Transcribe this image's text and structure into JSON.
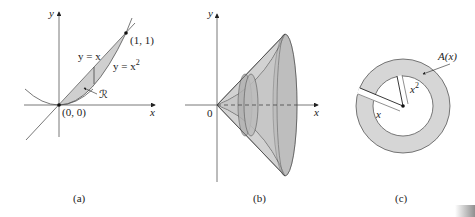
{
  "panels": [
    {
      "id": "a",
      "caption": "(a)",
      "axis_x": "x",
      "axis_y": "y",
      "origin_label": "(0, 0)",
      "point_label": "(1, 1)",
      "line_label": "y = x",
      "curve_label_base": "y = x",
      "curve_label_exp": "2",
      "region_label": "ℛ"
    },
    {
      "id": "b",
      "caption": "(b)",
      "axis_x": "x",
      "axis_y": "y",
      "origin_label": "0"
    },
    {
      "id": "c",
      "caption": "(c)",
      "area_label": "A(x)",
      "outer_radius_label": "x",
      "inner_radius_label_base": "x",
      "inner_radius_label_exp": "2"
    }
  ],
  "colors": {
    "ink": "#222222",
    "fill_light": "#d4d4d4",
    "fill_mid": "#bdbdbd",
    "fill_dark": "#a9a9a9",
    "axis": "#555555"
  }
}
